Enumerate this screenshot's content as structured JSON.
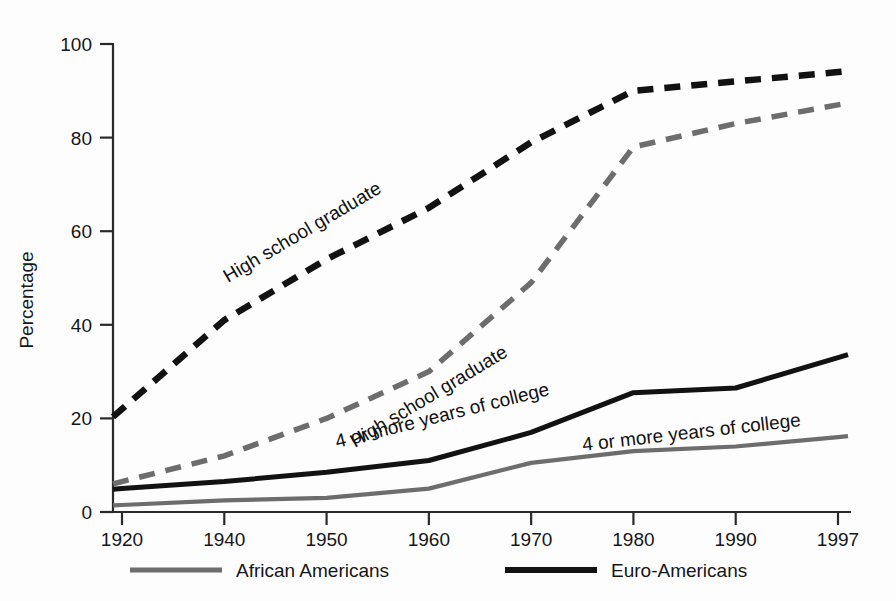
{
  "figure": {
    "background_color": "#fdfdfd"
  },
  "axes": {
    "y_title": "Percentage",
    "y_ticks": [
      "0",
      "20",
      "40",
      "60",
      "80",
      "100"
    ],
    "x_ticks": [
      "1920",
      "1940",
      "1950",
      "1960",
      "1970",
      "1980",
      "1990",
      "1997"
    ]
  },
  "legend": {
    "position": "bottom",
    "entries": [
      {
        "label": "African Americans",
        "color": "#6d6d6d",
        "style": "solid"
      },
      {
        "label": "Euro-Americans",
        "color": "#121212",
        "style": "solid"
      }
    ]
  },
  "inline_labels": [
    {
      "text": "High school graduate",
      "series": "euro-hs-grad"
    },
    {
      "text": "High school graduate",
      "series": "african-hs-grad"
    },
    {
      "text": "4 or more years of college",
      "series": "euro-college"
    },
    {
      "text": "4 or more years of college",
      "series": "african-college"
    }
  ],
  "colors": {
    "black": "#121212",
    "gray": "#6d6d6d",
    "axis": "#2a2a2a",
    "text": "#161616"
  },
  "chart_data": {
    "type": "line",
    "title": "",
    "xlabel": "",
    "ylabel": "Percentage",
    "ylim": [
      0,
      100
    ],
    "grid": false,
    "legend_position": "bottom",
    "x": [
      "1920",
      "1940",
      "1950",
      "1960",
      "1970",
      "1980",
      "1990",
      "1997"
    ],
    "series": [
      {
        "name": "High school graduate",
        "group": "Euro-Americans",
        "key": "euro-hs-grad",
        "color": "#121212",
        "style": "dashed",
        "values": [
          22,
          41,
          54,
          65,
          79,
          90,
          92,
          94
        ]
      },
      {
        "name": "High school graduate",
        "group": "African Americans",
        "key": "african-hs-grad",
        "color": "#6d6d6d",
        "style": "dashed",
        "values": [
          6.5,
          12,
          20,
          30,
          49,
          78,
          83,
          87
        ]
      },
      {
        "name": "4 or more years of college",
        "group": "Euro-Americans",
        "key": "euro-college",
        "color": "#121212",
        "style": "solid",
        "values": [
          5,
          6.5,
          8.5,
          11,
          17,
          25.5,
          26.5,
          33
        ]
      },
      {
        "name": "4 or more years of college",
        "group": "African Americans",
        "key": "african-college",
        "color": "#6d6d6d",
        "style": "solid",
        "values": [
          1.5,
          2.5,
          3,
          5,
          10.5,
          13,
          14,
          16
        ]
      }
    ]
  }
}
